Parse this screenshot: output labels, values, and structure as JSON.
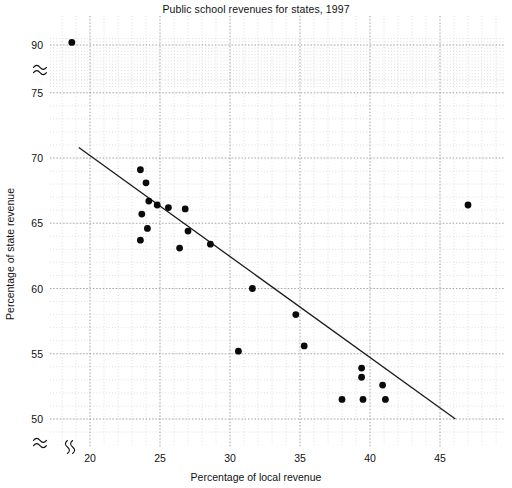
{
  "chart_data": {
    "type": "scatter",
    "title": "Public school revenues for states, 1997",
    "xlabel": "Percentage of local revenue",
    "ylabel": "Percentage of state revenue",
    "xlim": [
      17.8,
      49.0
    ],
    "ylim": [
      48.6,
      92.4
    ],
    "xticks": [
      20,
      25,
      30,
      35,
      40,
      45
    ],
    "yticks": [
      50,
      55,
      60,
      65,
      70,
      75,
      90
    ],
    "grid": true,
    "grid_minor": true,
    "legend": "none",
    "y_axis_break": true,
    "y_axis_break_between": [
      75,
      90
    ],
    "x_axis_break": true,
    "points": [
      {
        "x": 18.7,
        "y": 90.8
      },
      {
        "x": 23.6,
        "y": 69.1
      },
      {
        "x": 24.0,
        "y": 68.1
      },
      {
        "x": 24.2,
        "y": 66.7
      },
      {
        "x": 24.8,
        "y": 66.4
      },
      {
        "x": 25.6,
        "y": 66.2
      },
      {
        "x": 23.7,
        "y": 65.7
      },
      {
        "x": 24.1,
        "y": 64.6
      },
      {
        "x": 23.6,
        "y": 63.7
      },
      {
        "x": 26.8,
        "y": 66.1
      },
      {
        "x": 27.0,
        "y": 64.4
      },
      {
        "x": 26.4,
        "y": 63.1
      },
      {
        "x": 28.6,
        "y": 63.4
      },
      {
        "x": 31.6,
        "y": 60.0
      },
      {
        "x": 34.7,
        "y": 58.0
      },
      {
        "x": 35.3,
        "y": 55.6
      },
      {
        "x": 30.6,
        "y": 55.2
      },
      {
        "x": 39.4,
        "y": 53.9
      },
      {
        "x": 39.4,
        "y": 53.2
      },
      {
        "x": 40.9,
        "y": 52.6
      },
      {
        "x": 38.0,
        "y": 51.5
      },
      {
        "x": 39.5,
        "y": 51.5
      },
      {
        "x": 41.1,
        "y": 51.5
      },
      {
        "x": 47.0,
        "y": 66.4
      }
    ],
    "fit_line": {
      "x_start": 19.2,
      "y_start": 70.8,
      "x_end": 46.1,
      "y_end": 50.0
    }
  }
}
